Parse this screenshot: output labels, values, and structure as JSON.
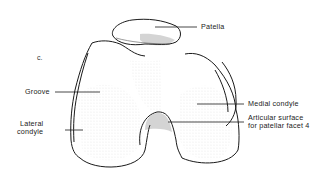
{
  "figure": {
    "panel_letter": "c.",
    "labels": {
      "patella": "Patella",
      "groove": "Groove",
      "lateral_condyle_line1": "Lateral",
      "lateral_condyle_line2": "condyle",
      "medial_condyle": "Medial condyle",
      "articular_line1": "Articular surface",
      "articular_line2": "for patellar facet 4"
    },
    "colors": {
      "outline": "#1a1a1a",
      "stipple": "#9a9a9a",
      "text": "#222222",
      "background": "#ffffff"
    }
  }
}
